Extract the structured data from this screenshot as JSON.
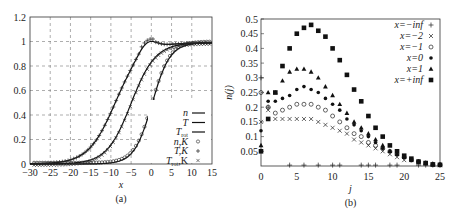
{
  "chart_data": [
    {
      "id": "a",
      "type": "line",
      "caption": "(a)",
      "title": "",
      "xlabel": "x",
      "ylabel": "",
      "xlim": [
        -30,
        15
      ],
      "ylim": [
        0,
        1.2
      ],
      "xticks": [
        -30,
        -25,
        -20,
        -15,
        -10,
        -5,
        0,
        5,
        10,
        15
      ],
      "yticks": [
        0,
        0.2,
        0.4,
        0.6,
        0.8,
        1,
        1.2
      ],
      "grid": true,
      "legend_position": "lower right",
      "legend": [
        {
          "label": "n",
          "style": "line"
        },
        {
          "label": "T",
          "style": "line"
        },
        {
          "label": "T_rot",
          "style": "line"
        },
        {
          "label": "n,K",
          "style": "circle"
        },
        {
          "label": "T,K",
          "style": "plus"
        },
        {
          "label": "T_rot,K",
          "style": "cross"
        }
      ],
      "series": [
        {
          "name": "T",
          "x": [
            -30,
            -25,
            -20,
            -17.5,
            -15,
            -12.5,
            -10,
            -8,
            -6,
            -4,
            -2,
            0,
            2,
            4,
            6,
            8,
            10,
            15
          ],
          "values": [
            0,
            0.01,
            0.05,
            0.1,
            0.18,
            0.3,
            0.5,
            0.7,
            0.9,
            1.05,
            1.08,
            1.05,
            1.02,
            1.0,
            0.99,
            0.99,
            0.99,
            0.99
          ]
        },
        {
          "name": "T_rot",
          "x": [
            -30,
            -25,
            -20,
            -17.5,
            -15,
            -12.5,
            -10,
            -8,
            -6,
            -4,
            -2,
            0,
            2,
            4,
            6,
            8,
            10,
            15
          ],
          "values": [
            0,
            0.0,
            0.02,
            0.04,
            0.07,
            0.12,
            0.22,
            0.36,
            0.55,
            0.73,
            0.85,
            0.92,
            0.96,
            0.98,
            0.99,
            0.99,
            0.99,
            0.99
          ]
        },
        {
          "name": "n",
          "x": [
            -30,
            -25,
            -20,
            -17.5,
            -15,
            -12.5,
            -10,
            -8,
            -6,
            -4,
            -2,
            0,
            2,
            4,
            6,
            8,
            10,
            15
          ],
          "values": [
            0,
            0,
            0,
            0,
            0.01,
            0.02,
            0.04,
            0.08,
            0.13,
            0.22,
            0.38,
            0.6,
            0.8,
            0.92,
            0.97,
            0.99,
            0.99,
            0.99
          ]
        }
      ]
    },
    {
      "id": "b",
      "type": "scatter",
      "caption": "(b)",
      "title": "",
      "xlabel": "j",
      "ylabel": "n(j)",
      "xlim": [
        0,
        25
      ],
      "ylim": [
        0,
        0.5
      ],
      "xticks": [
        0,
        5,
        10,
        15,
        20,
        25
      ],
      "yticks": [
        0,
        0.05,
        0.1,
        0.15,
        0.2,
        0.25,
        0.3,
        0.35,
        0.4,
        0.45,
        0.5
      ],
      "grid": false,
      "legend_position": "upper right",
      "legend": [
        {
          "label": "x=−inf",
          "marker": "+"
        },
        {
          "label": "x=−2",
          "marker": "×"
        },
        {
          "label": "x=−1",
          "marker": "○"
        },
        {
          "label": "x=0",
          "marker": "●"
        },
        {
          "label": "x=1",
          "marker": "▲"
        },
        {
          "label": "x=+inf",
          "marker": "■"
        }
      ],
      "x": [
        0,
        1,
        2,
        3,
        4,
        5,
        6,
        7,
        8,
        9,
        10,
        11,
        12,
        13,
        14,
        15,
        16,
        17,
        18,
        19,
        20,
        21,
        22,
        23,
        24,
        25
      ],
      "series": [
        {
          "name": "x=−inf",
          "marker": "plus",
          "values": [
            0.3,
            0.2,
            0,
            0,
            0.003,
            0,
            0,
            0,
            0,
            0,
            0,
            0,
            0,
            0,
            0,
            0,
            0,
            0,
            0,
            0,
            0,
            0,
            0,
            0,
            0,
            0
          ]
        },
        {
          "name": "x=−2",
          "marker": "cross",
          "values": [
            0.15,
            0.19,
            0.16,
            0.16,
            0.16,
            0.16,
            0.16,
            0.16,
            0.15,
            0.14,
            0.13,
            0.12,
            0.11,
            0.09,
            0.08,
            0.07,
            0.06,
            0.05,
            0.04,
            0.03,
            0.02,
            0.02,
            0.01,
            0.01,
            0.005,
            0.003
          ]
        },
        {
          "name": "x=−1",
          "marker": "circle",
          "values": [
            0.25,
            0.2,
            0.18,
            0.19,
            0.2,
            0.21,
            0.21,
            0.21,
            0.2,
            0.19,
            0.17,
            0.15,
            0.13,
            0.11,
            0.1,
            0.08,
            0.07,
            0.06,
            0.05,
            0.04,
            0.03,
            0.02,
            0.015,
            0.01,
            0.006,
            0.004
          ]
        },
        {
          "name": "x=0",
          "marker": "dot",
          "values": [
            0.12,
            0.22,
            0.22,
            0.23,
            0.24,
            0.26,
            0.27,
            0.26,
            0.25,
            0.23,
            0.21,
            0.19,
            0.16,
            0.14,
            0.12,
            0.1,
            0.08,
            0.06,
            0.05,
            0.04,
            0.03,
            0.02,
            0.015,
            0.01,
            0.007,
            0.005
          ]
        },
        {
          "name": "x=1",
          "marker": "triangle",
          "values": [
            0.07,
            0.25,
            0.25,
            0.29,
            0.32,
            0.33,
            0.33,
            0.32,
            0.3,
            0.27,
            0.24,
            0.21,
            0.18,
            0.15,
            0.13,
            0.11,
            0.09,
            0.07,
            0.05,
            0.04,
            0.03,
            0.02,
            0.015,
            0.01,
            0.007,
            0.005
          ]
        },
        {
          "name": "x=+inf",
          "marker": "square",
          "values": [
            0.05,
            0.16,
            0.25,
            0.34,
            0.4,
            0.45,
            0.47,
            0.48,
            0.46,
            0.44,
            0.4,
            0.36,
            0.31,
            0.26,
            0.22,
            0.17,
            0.13,
            0.1,
            0.07,
            0.05,
            0.035,
            0.025,
            0.015,
            0.01,
            0.005,
            0.004
          ]
        }
      ]
    }
  ]
}
